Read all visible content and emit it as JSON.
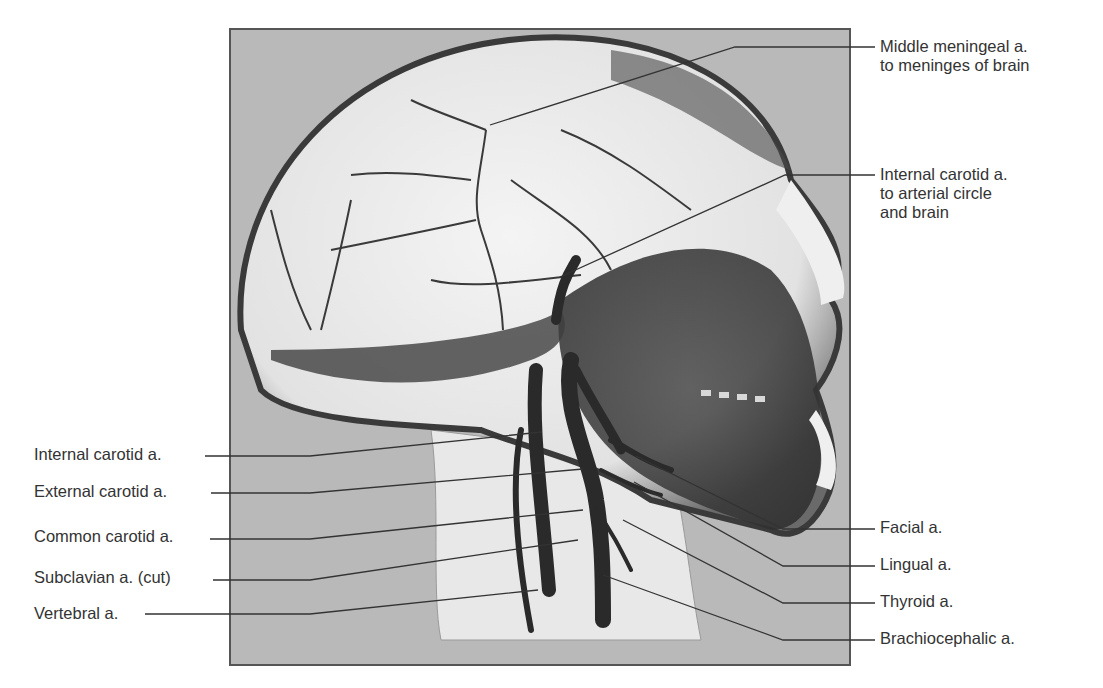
{
  "figure": {
    "panel_background": "#b9b9b9",
    "panel_border": "#555555",
    "leader_color": "#333333",
    "label_color": "#333333"
  },
  "labels_right": [
    {
      "id": "middle-meningeal",
      "lines": [
        "Middle meningeal a.",
        "to meninges of brain"
      ],
      "top": 37,
      "leader": {
        "points": [
          [
            875,
            47
          ],
          [
            735,
            47
          ],
          [
            490,
            125
          ]
        ]
      }
    },
    {
      "id": "internal-carotid-upper",
      "lines": [
        "Internal carotid a.",
        "to arterial circle",
        "and brain"
      ],
      "top": 165,
      "leader": {
        "points": [
          [
            875,
            175
          ],
          [
            785,
            175
          ],
          [
            560,
            277
          ]
        ]
      }
    },
    {
      "id": "facial",
      "lines": [
        "Facial a."
      ],
      "top": 518,
      "leader": {
        "points": [
          [
            875,
            529
          ],
          [
            783,
            529
          ],
          [
            636,
            456
          ]
        ]
      }
    },
    {
      "id": "lingual",
      "lines": [
        "Lingual a."
      ],
      "top": 555,
      "leader": {
        "points": [
          [
            875,
            566
          ],
          [
            783,
            566
          ],
          [
            634,
            482
          ]
        ]
      }
    },
    {
      "id": "thyroid",
      "lines": [
        "Thyroid a."
      ],
      "top": 592,
      "leader": {
        "points": [
          [
            875,
            603
          ],
          [
            783,
            603
          ],
          [
            623,
            520
          ]
        ]
      }
    },
    {
      "id": "brachiocephalic",
      "lines": [
        "Brachiocephalic a."
      ],
      "top": 629,
      "leader": {
        "points": [
          [
            875,
            640
          ],
          [
            783,
            640
          ],
          [
            603,
            575
          ]
        ]
      }
    }
  ],
  "labels_left": [
    {
      "id": "internal-carotid-lower",
      "lines": [
        "Internal carotid a."
      ],
      "left": 34,
      "top": 445,
      "leader": {
        "points": [
          [
            205,
            456
          ],
          [
            310,
            456
          ],
          [
            542,
            432
          ]
        ]
      }
    },
    {
      "id": "external-carotid",
      "lines": [
        "External carotid a."
      ],
      "left": 34,
      "top": 482,
      "leader": {
        "points": [
          [
            211,
            493
          ],
          [
            310,
            493
          ],
          [
            583,
            469
          ]
        ]
      }
    },
    {
      "id": "common-carotid",
      "lines": [
        "Common carotid a."
      ],
      "left": 34,
      "top": 527,
      "leader": {
        "points": [
          [
            210,
            539
          ],
          [
            310,
            539
          ],
          [
            583,
            510
          ]
        ]
      }
    },
    {
      "id": "subclavian",
      "lines": [
        "Subclavian a. (cut)"
      ],
      "left": 34,
      "top": 568,
      "leader": {
        "points": [
          [
            213,
            580
          ],
          [
            310,
            580
          ],
          [
            578,
            540
          ]
        ]
      }
    },
    {
      "id": "vertebral",
      "lines": [
        "Vertebral a."
      ],
      "left": 34,
      "top": 604,
      "leader": {
        "points": [
          [
            145,
            614
          ],
          [
            310,
            614
          ],
          [
            538,
            590
          ]
        ]
      }
    }
  ]
}
